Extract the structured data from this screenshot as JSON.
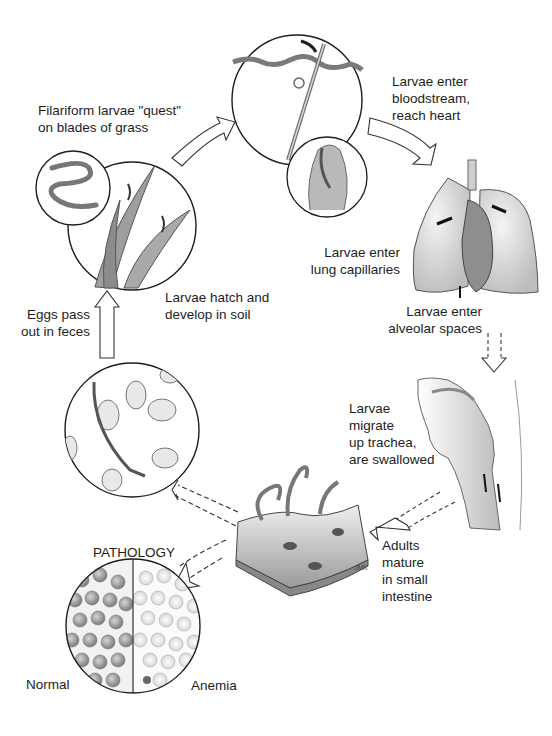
{
  "diagram": {
    "type": "life-cycle",
    "stages": [
      {
        "id": "quest",
        "lines": [
          "Filariform larvae \"quest\"",
          "on blades of grass"
        ]
      },
      {
        "id": "bloodstream",
        "lines": [
          "Larvae enter",
          "bloodstream,",
          "reach heart"
        ]
      },
      {
        "id": "lung-capillaries",
        "lines": [
          "Larvae enter",
          "lung capillaries"
        ]
      },
      {
        "id": "alveolar",
        "lines": [
          "Larvae enter",
          "alveolar spaces"
        ]
      },
      {
        "id": "trachea",
        "lines": [
          "Larvae",
          "migrate",
          "up trachea,",
          "are swallowed"
        ]
      },
      {
        "id": "intestine",
        "lines": [
          "Adults",
          "mature",
          "in small",
          "intestine"
        ]
      },
      {
        "id": "eggs",
        "lines": [
          "Eggs pass",
          "out in feces"
        ]
      },
      {
        "id": "hatch",
        "lines": [
          "Larvae hatch and",
          "develop in soil"
        ]
      }
    ],
    "pathology": {
      "title": "PATHOLOGY",
      "left_label": "Normal",
      "right_label": "Anemia"
    },
    "signature": "JMK",
    "colors": {
      "ink": "#1d1d1d",
      "shade": "#8a8a8a",
      "light": "#d9d9d9",
      "background": "#ffffff"
    }
  }
}
